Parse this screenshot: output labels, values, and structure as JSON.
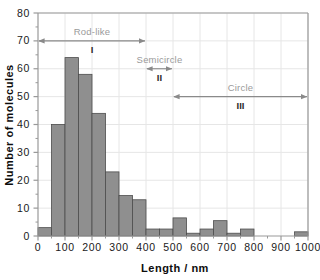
{
  "chart_data": {
    "type": "bar",
    "title": "",
    "subtitle": "",
    "xlabel": "Length / nm",
    "ylabel": "Number of molecules",
    "xlim": [
      0,
      1000
    ],
    "ylim": [
      0,
      80
    ],
    "grid": true,
    "legend_position": "none",
    "bar_color": "#8f8f8f",
    "bar_edge_color": "#4d4d4d",
    "axis_color": "#999999",
    "bin_width": 50,
    "x_ticks": [
      0,
      100,
      200,
      300,
      400,
      500,
      600,
      700,
      800,
      900,
      1000
    ],
    "x_tick_labels": [
      "0",
      "100",
      "200",
      "300",
      "400",
      "500",
      "600",
      "700",
      "800",
      "900",
      "1000"
    ],
    "x_minor_ticks": [
      50,
      150,
      250,
      350,
      450,
      550,
      650,
      750,
      850,
      950
    ],
    "y_ticks": [
      0,
      10,
      20,
      30,
      40,
      50,
      60,
      70,
      80
    ],
    "y_tick_labels": [
      "0",
      "10",
      "20",
      "30",
      "40",
      "50",
      "60",
      "70",
      "80"
    ],
    "y_minor_step": 5,
    "bins": [
      {
        "x0": 0,
        "x1": 50,
        "value": 3
      },
      {
        "x0": 50,
        "x1": 100,
        "value": 40
      },
      {
        "x0": 100,
        "x1": 150,
        "value": 64
      },
      {
        "x0": 150,
        "x1": 200,
        "value": 58
      },
      {
        "x0": 200,
        "x1": 250,
        "value": 44
      },
      {
        "x0": 250,
        "x1": 300,
        "value": 23
      },
      {
        "x0": 300,
        "x1": 350,
        "value": 14.5
      },
      {
        "x0": 350,
        "x1": 400,
        "value": 13
      },
      {
        "x0": 400,
        "x1": 450,
        "value": 2.5
      },
      {
        "x0": 450,
        "x1": 500,
        "value": 2.5
      },
      {
        "x0": 500,
        "x1": 550,
        "value": 6.5
      },
      {
        "x0": 550,
        "x1": 600,
        "value": 1
      },
      {
        "x0": 600,
        "x1": 650,
        "value": 2.5
      },
      {
        "x0": 650,
        "x1": 700,
        "value": 5.5
      },
      {
        "x0": 700,
        "x1": 750,
        "value": 1
      },
      {
        "x0": 750,
        "x1": 800,
        "value": 2.5
      },
      {
        "x0": 800,
        "x1": 850,
        "value": 0
      },
      {
        "x0": 850,
        "x1": 900,
        "value": 0
      },
      {
        "x0": 900,
        "x1": 950,
        "value": 0
      },
      {
        "x0": 950,
        "x1": 1000,
        "value": 1.5
      }
    ],
    "annotations": [
      {
        "label": "Rod-like",
        "roman": "I",
        "x_start": 0,
        "x_end": 400,
        "y": 70,
        "arrow": "double"
      },
      {
        "label": "Semicircle",
        "roman": "II",
        "x_start": 400,
        "x_end": 500,
        "y": 60,
        "arrow": "double"
      },
      {
        "label": "Circle",
        "roman": "III",
        "x_start": 500,
        "x_end": 1000,
        "y": 50,
        "arrow": "double"
      }
    ]
  }
}
